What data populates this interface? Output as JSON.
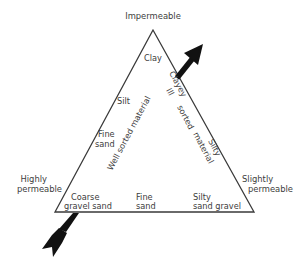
{
  "diagram": {
    "type": "ternary-triangle",
    "vertices": {
      "top": "Impermeable",
      "left": [
        "Highly",
        "permeable"
      ],
      "right": [
        "Slightly",
        "permeable"
      ]
    },
    "corner_materials": {
      "top": "Clay",
      "left_edge_upper": "Silt",
      "left_edge_lower": [
        "Fine",
        "sand"
      ],
      "bottom_left": [
        "Coarse",
        "gravel sand"
      ],
      "bottom_middle": [
        "Fine",
        "sand"
      ],
      "bottom_right": [
        "Silty",
        "sand gravel"
      ]
    },
    "right_edge_labels": {
      "upper": "Clayey",
      "lower": "Silty"
    },
    "gradients": {
      "well_sorted": "Well sorted material",
      "ill_sorted": [
        "Ill",
        "sorted",
        "material"
      ]
    },
    "arrow": {
      "description": "Large arrow passing through the triangle from bottom-left to upper-right",
      "color": "#111111"
    },
    "line_color": "#3a3a3a"
  }
}
